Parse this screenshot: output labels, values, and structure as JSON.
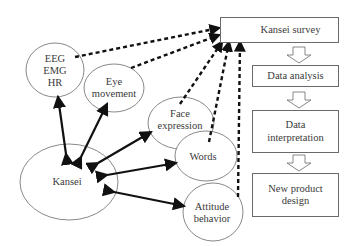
{
  "diagram": {
    "nodes": {
      "eeg": {
        "label": "EEG\nEMG\nHR"
      },
      "eye": {
        "label": "Eye\nmovement"
      },
      "face": {
        "label": "Face\nexpression"
      },
      "kansei": {
        "label": "Kansei"
      },
      "words": {
        "label": "Words"
      },
      "attitude": {
        "label": "Attitude\nbehavior"
      }
    },
    "process": {
      "survey": "Kansei survey",
      "analysis": "Data analysis",
      "interpretation": "Data\ninterpretation",
      "design": "New product\ndesign"
    },
    "edges": [
      {
        "from": "kansei",
        "to": "eeg",
        "style": "solid-double-arrow"
      },
      {
        "from": "kansei",
        "to": "eye",
        "style": "solid-double-arrow"
      },
      {
        "from": "kansei",
        "to": "face",
        "style": "solid-double-arrow"
      },
      {
        "from": "kansei",
        "to": "words",
        "style": "solid-double-arrow"
      },
      {
        "from": "kansei",
        "to": "attitude",
        "style": "solid-double-arrow"
      },
      {
        "from": "eeg",
        "to": "survey",
        "style": "dotted-arrow"
      },
      {
        "from": "eye",
        "to": "survey",
        "style": "dotted-arrow"
      },
      {
        "from": "face",
        "to": "survey",
        "style": "dotted-arrow"
      },
      {
        "from": "words",
        "to": "survey",
        "style": "dotted-arrow"
      },
      {
        "from": "attitude",
        "to": "survey",
        "style": "dotted-arrow"
      },
      {
        "from": "survey",
        "to": "analysis",
        "style": "hollow-block-arrow"
      },
      {
        "from": "analysis",
        "to": "interpretation",
        "style": "hollow-block-arrow"
      },
      {
        "from": "interpretation",
        "to": "design",
        "style": "hollow-block-arrow"
      }
    ],
    "colors": {
      "stroke": "#6a6a6a",
      "arrow": "#111111",
      "text": "#3a3a3a"
    }
  }
}
